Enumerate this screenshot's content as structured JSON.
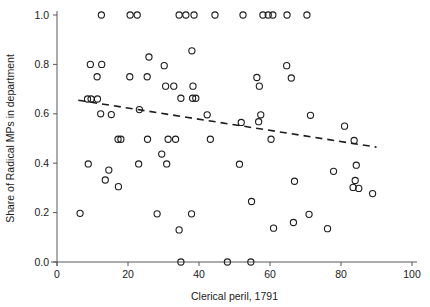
{
  "chart_data": {
    "type": "scatter",
    "title": "",
    "xlabel": "Clerical peril, 1791",
    "ylabel": "Share of Radical MPs in department",
    "xlim": [
      0,
      100
    ],
    "ylim": [
      0.0,
      1.0
    ],
    "xticks": [
      0,
      20,
      40,
      60,
      80,
      100
    ],
    "xticklabels": [
      "0",
      "20",
      "40",
      "60",
      "80",
      "100"
    ],
    "yticks": [
      0.0,
      0.2,
      0.4,
      0.6,
      0.8,
      1.0
    ],
    "yticklabels": [
      "0.0",
      "0.2",
      "0.4",
      "0.6",
      "0.8",
      "1.0"
    ],
    "grid": false,
    "legend": null,
    "marker": "open-circle",
    "marker_color": "#1c1c1c",
    "series": [
      {
        "name": "Departments",
        "points": [
          [
            12.5,
            1.0
          ],
          [
            20.6,
            1.0
          ],
          [
            22.6,
            1.0
          ],
          [
            34.4,
            1.0
          ],
          [
            36.3,
            1.0
          ],
          [
            38.6,
            1.0
          ],
          [
            44.5,
            1.0
          ],
          [
            52.4,
            1.0
          ],
          [
            58.0,
            1.0
          ],
          [
            59.5,
            1.0
          ],
          [
            60.8,
            1.0
          ],
          [
            64.8,
            1.0
          ],
          [
            70.4,
            1.0
          ],
          [
            38.0,
            0.855
          ],
          [
            25.9,
            0.83
          ],
          [
            9.4,
            0.8
          ],
          [
            12.6,
            0.8
          ],
          [
            30.2,
            0.795
          ],
          [
            64.7,
            0.795
          ],
          [
            11.3,
            0.75
          ],
          [
            20.5,
            0.75
          ],
          [
            25.4,
            0.75
          ],
          [
            56.3,
            0.747
          ],
          [
            66.0,
            0.745
          ],
          [
            30.6,
            0.712
          ],
          [
            32.9,
            0.712
          ],
          [
            38.3,
            0.712
          ],
          [
            57.0,
            0.712
          ],
          [
            34.9,
            0.663
          ],
          [
            38.2,
            0.663
          ],
          [
            39.1,
            0.663
          ],
          [
            8.6,
            0.66
          ],
          [
            9.6,
            0.66
          ],
          [
            11.4,
            0.66
          ],
          [
            12.3,
            0.6
          ],
          [
            15.3,
            0.597
          ],
          [
            42.3,
            0.596
          ],
          [
            57.4,
            0.596
          ],
          [
            71.4,
            0.594
          ],
          [
            23.2,
            0.617
          ],
          [
            51.9,
            0.565
          ],
          [
            56.8,
            0.568
          ],
          [
            81.0,
            0.55
          ],
          [
            17.2,
            0.497
          ],
          [
            18.0,
            0.497
          ],
          [
            25.5,
            0.497
          ],
          [
            31.3,
            0.497
          ],
          [
            33.4,
            0.497
          ],
          [
            43.2,
            0.497
          ],
          [
            60.3,
            0.497
          ],
          [
            83.7,
            0.492
          ],
          [
            29.5,
            0.437
          ],
          [
            8.8,
            0.397
          ],
          [
            23.0,
            0.397
          ],
          [
            30.9,
            0.397
          ],
          [
            51.4,
            0.396
          ],
          [
            84.3,
            0.392
          ],
          [
            14.6,
            0.372
          ],
          [
            77.9,
            0.367
          ],
          [
            13.6,
            0.332
          ],
          [
            66.9,
            0.327
          ],
          [
            84.0,
            0.33
          ],
          [
            17.3,
            0.305
          ],
          [
            83.4,
            0.302
          ],
          [
            85.0,
            0.298
          ],
          [
            88.9,
            0.277
          ],
          [
            54.8,
            0.245
          ],
          [
            6.5,
            0.197
          ],
          [
            28.2,
            0.195
          ],
          [
            37.9,
            0.195
          ],
          [
            71.0,
            0.193
          ],
          [
            66.6,
            0.16
          ],
          [
            61.0,
            0.137
          ],
          [
            76.2,
            0.135
          ],
          [
            34.4,
            0.13
          ],
          [
            34.9,
            0.0
          ],
          [
            48.0,
            0.0
          ],
          [
            54.6,
            0.0
          ]
        ]
      }
    ],
    "fit_line": {
      "style": "dashed",
      "color": "#1c1c1c",
      "x_start": 6,
      "y_start": 0.655,
      "x_end": 90,
      "y_end": 0.465
    }
  }
}
